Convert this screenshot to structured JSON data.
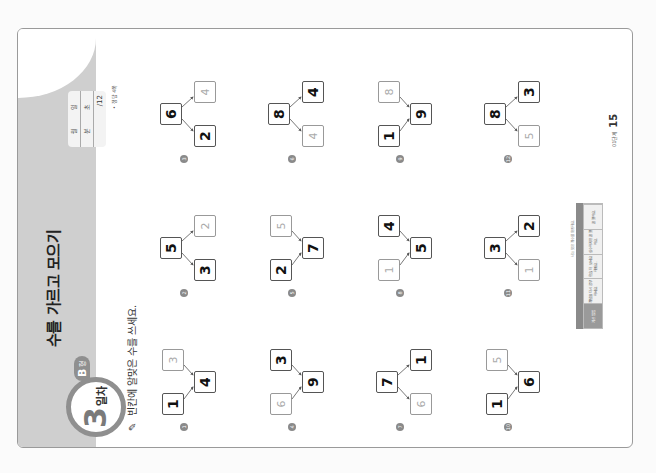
{
  "header": {
    "day_number": "3",
    "day_word": "일차",
    "level_letter": "B",
    "level_word": "형",
    "title": "수를 가르고 모으기",
    "score": {
      "row1": [
        "월",
        "일"
      ],
      "row2": [
        "분",
        "초"
      ],
      "row3": "/12"
    },
    "answer_note": "• 정답 4쪽"
  },
  "instruction": "빈칸에 알맞은 수를 쓰세요.",
  "problems": [
    {
      "num": "1",
      "type": "combine",
      "top": "1",
      "bottom": "3",
      "top_hint": false,
      "bottom_hint": true,
      "result": "4",
      "result_hint": false
    },
    {
      "num": "2",
      "type": "split",
      "source": "5",
      "source_hint": false,
      "top": "3",
      "bottom": "2",
      "top_hint": false,
      "bottom_hint": true
    },
    {
      "num": "3",
      "type": "split",
      "source": "6",
      "source_hint": false,
      "top": "2",
      "bottom": "4",
      "top_hint": false,
      "bottom_hint": true
    },
    {
      "num": "4",
      "type": "combine",
      "top": "6",
      "bottom": "3",
      "top_hint": true,
      "bottom_hint": false,
      "result": "9",
      "result_hint": false
    },
    {
      "num": "5",
      "type": "combine",
      "top": "2",
      "bottom": "5",
      "top_hint": false,
      "bottom_hint": true,
      "result": "7",
      "result_hint": false
    },
    {
      "num": "6",
      "type": "split",
      "source": "8",
      "source_hint": false,
      "top": "4",
      "bottom": "4",
      "top_hint": true,
      "bottom_hint": false
    },
    {
      "num": "7",
      "type": "split",
      "source": "7",
      "source_hint": false,
      "top": "6",
      "bottom": "1",
      "top_hint": true,
      "bottom_hint": false
    },
    {
      "num": "8",
      "type": "combine",
      "top": "1",
      "bottom": "4",
      "top_hint": true,
      "bottom_hint": false,
      "result": "5",
      "result_hint": false
    },
    {
      "num": "9",
      "type": "combine",
      "top": "1",
      "bottom": "8",
      "top_hint": false,
      "bottom_hint": true,
      "result": "9",
      "result_hint": false
    },
    {
      "num": "10",
      "type": "combine",
      "top": "1",
      "bottom": "5",
      "top_hint": false,
      "bottom_hint": true,
      "result": "6",
      "result_hint": false
    },
    {
      "num": "11",
      "type": "split",
      "source": "3",
      "source_hint": false,
      "top": "1",
      "bottom": "2",
      "top_hint": true,
      "bottom_hint": false
    },
    {
      "num": "12",
      "type": "split",
      "source": "8",
      "source_hint": false,
      "top": "5",
      "bottom": "3",
      "top_hint": true,
      "bottom_hint": false
    }
  ],
  "footer": {
    "caption": "나는 맞은 개수를 확인해요.",
    "table_head": [
      "개수",
      "",
      "",
      ""
    ],
    "table_cells": [
      "계산 방법",
      "개념을 다시 공부하세요.",
      "학습 더 보세요 해봐요.",
      "실수하지만 잘 했어요.",
      "잘 했어요."
    ],
    "level_label": "01단계",
    "page_number": "15"
  },
  "colors": {
    "band": "#cfcfcf",
    "accent_gray": "#8f8f8f",
    "frame": "#9a9a9a"
  }
}
